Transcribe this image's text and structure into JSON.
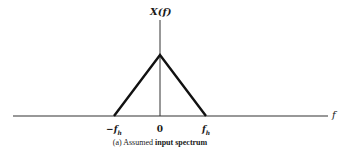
{
  "diagram": {
    "y_axis_label": "X(f)",
    "x_axis_label": "f",
    "ticks": [
      {
        "label": "−f",
        "sub": "h",
        "x": 114
      },
      {
        "label": "0",
        "sub": "",
        "x": 160
      },
      {
        "label": "f",
        "sub": "h",
        "x": 206
      }
    ],
    "caption": {
      "prefix": "(a) Assumed",
      "emphasis": "input spectrum"
    },
    "shape": "triangle",
    "colors": {
      "line": "#1a1a1a",
      "background": "#ffffff"
    }
  }
}
